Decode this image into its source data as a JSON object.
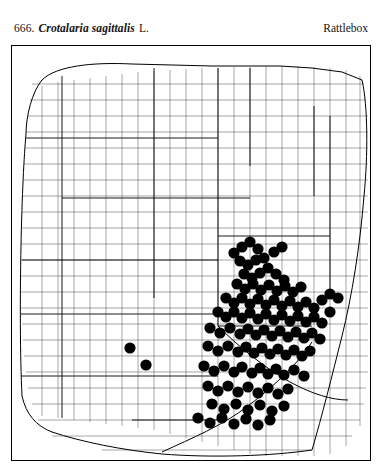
{
  "page": {
    "number": "666.",
    "scientific_name": "Crotalaria sagittalis",
    "authority": "L.",
    "common_name": "Rattlebox"
  },
  "map": {
    "title": "distribution-map",
    "dot_color": "#000000",
    "line_color": "#000000",
    "background_color": "#ffffff",
    "dot_radius": 5.6,
    "dots": [
      [
        222,
        207
      ],
      [
        230,
        201
      ],
      [
        238,
        196
      ],
      [
        246,
        203
      ],
      [
        252,
        212
      ],
      [
        262,
        206
      ],
      [
        270,
        201
      ],
      [
        228,
        215
      ],
      [
        236,
        219
      ],
      [
        244,
        214
      ],
      [
        232,
        228
      ],
      [
        240,
        232
      ],
      [
        248,
        227
      ],
      [
        256,
        222
      ],
      [
        264,
        228
      ],
      [
        272,
        234
      ],
      [
        225,
        238
      ],
      [
        233,
        243
      ],
      [
        241,
        238
      ],
      [
        249,
        244
      ],
      [
        257,
        239
      ],
      [
        265,
        245
      ],
      [
        273,
        240
      ],
      [
        281,
        246
      ],
      [
        289,
        241
      ],
      [
        214,
        252
      ],
      [
        222,
        257
      ],
      [
        230,
        252
      ],
      [
        238,
        258
      ],
      [
        246,
        253
      ],
      [
        254,
        259
      ],
      [
        262,
        254
      ],
      [
        270,
        260
      ],
      [
        278,
        255
      ],
      [
        286,
        261
      ],
      [
        294,
        256
      ],
      [
        302,
        262
      ],
      [
        310,
        254
      ],
      [
        318,
        248
      ],
      [
        326,
        252
      ],
      [
        206,
        266
      ],
      [
        214,
        271
      ],
      [
        222,
        266
      ],
      [
        230,
        272
      ],
      [
        238,
        267
      ],
      [
        246,
        273
      ],
      [
        254,
        268
      ],
      [
        262,
        274
      ],
      [
        270,
        269
      ],
      [
        278,
        275
      ],
      [
        286,
        270
      ],
      [
        294,
        276
      ],
      [
        302,
        271
      ],
      [
        310,
        277
      ],
      [
        318,
        266
      ],
      [
        198,
        282
      ],
      [
        208,
        287
      ],
      [
        218,
        282
      ],
      [
        228,
        288
      ],
      [
        236,
        283
      ],
      [
        244,
        289
      ],
      [
        252,
        284
      ],
      [
        260,
        290
      ],
      [
        268,
        285
      ],
      [
        276,
        291
      ],
      [
        284,
        286
      ],
      [
        292,
        292
      ],
      [
        300,
        287
      ],
      [
        308,
        293
      ],
      [
        118,
        302
      ],
      [
        134,
        319
      ],
      [
        196,
        300
      ],
      [
        206,
        305
      ],
      [
        216,
        300
      ],
      [
        226,
        306
      ],
      [
        234,
        301
      ],
      [
        242,
        307
      ],
      [
        250,
        302
      ],
      [
        258,
        308
      ],
      [
        266,
        303
      ],
      [
        274,
        309
      ],
      [
        282,
        304
      ],
      [
        290,
        310
      ],
      [
        298,
        305
      ],
      [
        192,
        320
      ],
      [
        202,
        325
      ],
      [
        212,
        320
      ],
      [
        222,
        326
      ],
      [
        230,
        321
      ],
      [
        240,
        327
      ],
      [
        248,
        322
      ],
      [
        256,
        328
      ],
      [
        264,
        323
      ],
      [
        272,
        329
      ],
      [
        282,
        324
      ],
      [
        292,
        330
      ],
      [
        196,
        340
      ],
      [
        206,
        345
      ],
      [
        216,
        340
      ],
      [
        226,
        346
      ],
      [
        236,
        341
      ],
      [
        246,
        347
      ],
      [
        256,
        342
      ],
      [
        266,
        348
      ],
      [
        276,
        343
      ],
      [
        200,
        358
      ],
      [
        212,
        363
      ],
      [
        224,
        358
      ],
      [
        236,
        364
      ],
      [
        248,
        359
      ],
      [
        260,
        365
      ],
      [
        272,
        360
      ],
      [
        186,
        372
      ],
      [
        198,
        377
      ],
      [
        210,
        372
      ],
      [
        222,
        378
      ],
      [
        234,
        373
      ],
      [
        246,
        379
      ],
      [
        258,
        374
      ]
    ]
  }
}
